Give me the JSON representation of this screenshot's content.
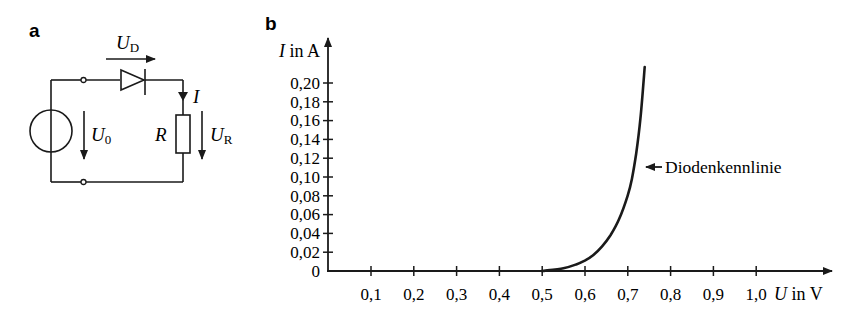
{
  "panel_a": {
    "label": "a",
    "circuit": {
      "diode_voltage": {
        "symbol": "U",
        "sub": "D"
      },
      "source_voltage": {
        "symbol": "U",
        "sub": "0"
      },
      "resistor": {
        "symbol": "R"
      },
      "resistor_voltage": {
        "symbol": "U",
        "sub": "R"
      },
      "current": {
        "symbol": "I"
      }
    }
  },
  "panel_b": {
    "label": "b",
    "y_axis_label": {
      "symbol": "I",
      "unit_text": " in A"
    },
    "x_axis_label": {
      "symbol": "U",
      "unit_text": " in V"
    },
    "annotation": "Diodenkennlinie"
  },
  "chart_data": {
    "type": "line",
    "title": "",
    "xlabel": "U in V",
    "ylabel": "I in A",
    "xlim": [
      0,
      1.0
    ],
    "ylim": [
      0,
      0.22
    ],
    "x_ticks": [
      "0,1",
      "0,2",
      "0,3",
      "0,4",
      "0,5",
      "0,6",
      "0,7",
      "0,8",
      "0,9",
      "1,0"
    ],
    "y_ticks": [
      "0",
      "0,02",
      "0,04",
      "0,06",
      "0,08",
      "0,10",
      "0,12",
      "0,14",
      "0,16",
      "0,18",
      "0,20"
    ],
    "grid": false,
    "legend": null,
    "annotations": [
      {
        "text": "Diodenkennlinie",
        "x": 0.72,
        "y": 0.098
      }
    ],
    "series": [
      {
        "name": "Diodenkennlinie",
        "x": [
          0.5,
          0.55,
          0.58,
          0.6,
          0.62,
          0.64,
          0.66,
          0.68,
          0.7,
          0.71,
          0.72,
          0.73,
          0.74
        ],
        "y": [
          0.0,
          0.003,
          0.007,
          0.011,
          0.017,
          0.026,
          0.038,
          0.055,
          0.08,
          0.098,
          0.125,
          0.162,
          0.217
        ]
      }
    ]
  }
}
